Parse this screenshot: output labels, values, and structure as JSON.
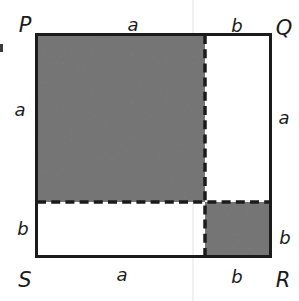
{
  "figure": {
    "vertices": {
      "top_left": "P",
      "top_right": "Q",
      "bottom_right": "R",
      "bottom_left": "S"
    },
    "sides": {
      "top": {
        "a": "a",
        "b": "b"
      },
      "right": {
        "a": "a",
        "b": "b"
      },
      "bottom": {
        "a": "a",
        "b": "b"
      },
      "left": {
        "a": "a",
        "b": "b"
      }
    },
    "colors": {
      "shaded_region": "#8c8c8c",
      "line": "#1b1b1b",
      "background": "#ffffff",
      "scan_artifact": "#e8e8e8"
    }
  }
}
